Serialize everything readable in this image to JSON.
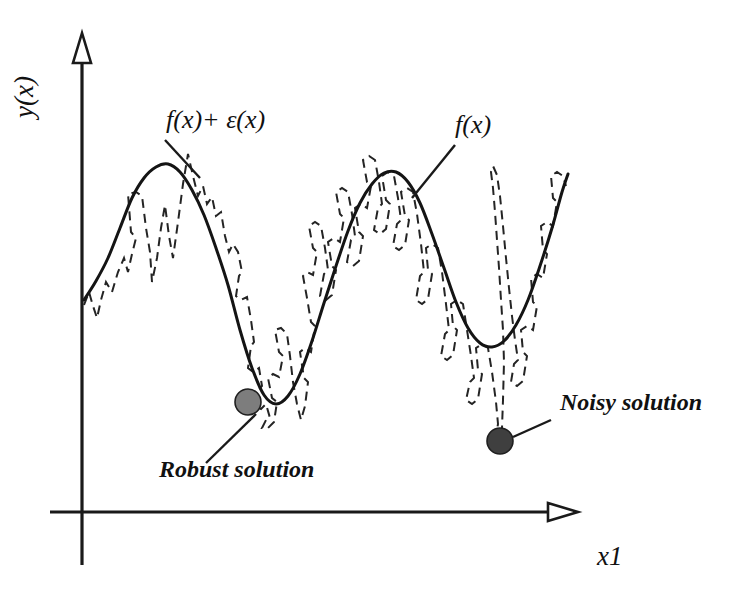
{
  "figure": {
    "background_color": "#ffffff",
    "ink_color": "#141414"
  },
  "axes": {
    "y_label": "y(x)",
    "x_label": "x1",
    "y_axis_name": "vertical-axis",
    "x_axis_name": "horizontal-axis",
    "origin": [
      82,
      512
    ],
    "y_axis_top": 33,
    "y_axis_bottom": 565,
    "x_axis_left": 50,
    "x_axis_right": 578,
    "arrow_style": "hollow-triangle"
  },
  "annotations": {
    "noisy_curve_label": "f(x)+ ε(x)",
    "smooth_curve_label": "f(x)",
    "robust_point_label": "Robust solution",
    "noisy_point_label": "Noisy solution"
  },
  "markers": {
    "robust": {
      "label": "Robust solution",
      "x": 248,
      "y": 402,
      "radius": 13,
      "fill": "#7d7d7d",
      "stroke": "#1f1f1f"
    },
    "noisy": {
      "label": "Noisy solution",
      "x": 500,
      "y": 441,
      "radius": 13,
      "fill": "#3f3f3f",
      "stroke": "#1f1f1f"
    }
  },
  "label_positions": {
    "noisy_curve": {
      "x": 166,
      "y": 128,
      "leader": [
        165,
        140,
        200,
        178
      ]
    },
    "smooth_curve": {
      "x": 455,
      "y": 133,
      "leader": [
        455,
        145,
        412,
        198
      ]
    },
    "robust_point": {
      "x": 159,
      "y": 477,
      "leader": [
        256,
        414,
        206,
        463
      ]
    },
    "noisy_point": {
      "x": 560,
      "y": 410,
      "leader": [
        513,
        437,
        551,
        420
      ]
    },
    "y_axis_label": {
      "x": 33,
      "y": 76
    },
    "x_axis_label": {
      "x": 597,
      "y": 565
    }
  },
  "chart_data": {
    "type": "line",
    "title": "",
    "xlabel": "x1",
    "ylabel": "y(x)",
    "grid": false,
    "legend_position": "inline-annotations",
    "axis_ranges": {
      "x": [
        82,
        578
      ],
      "y_pixels": [
        512,
        33
      ]
    },
    "series": [
      {
        "name": "f(x)",
        "style": "solid",
        "color": "#141414",
        "description": "Smooth underlying objective function with two maxima and two minima; global-shaped basin on left is wide, basin on right is narrower.",
        "points": [
          [
            84,
            300
          ],
          [
            96,
            281
          ],
          [
            108,
            258
          ],
          [
            120,
            228
          ],
          [
            132,
            198
          ],
          [
            144,
            178
          ],
          [
            156,
            167
          ],
          [
            168,
            164
          ],
          [
            180,
            172
          ],
          [
            192,
            190
          ],
          [
            204,
            215
          ],
          [
            216,
            248
          ],
          [
            228,
            285
          ],
          [
            240,
            330
          ],
          [
            252,
            368
          ],
          [
            264,
            395
          ],
          [
            276,
            404
          ],
          [
            288,
            396
          ],
          [
            300,
            374
          ],
          [
            312,
            341
          ],
          [
            324,
            303
          ],
          [
            336,
            266
          ],
          [
            348,
            231
          ],
          [
            360,
            203
          ],
          [
            372,
            184
          ],
          [
            384,
            173
          ],
          [
            396,
            172
          ],
          [
            408,
            182
          ],
          [
            420,
            203
          ],
          [
            432,
            234
          ],
          [
            444,
            268
          ],
          [
            456,
            302
          ],
          [
            468,
            328
          ],
          [
            480,
            343
          ],
          [
            492,
            347
          ],
          [
            504,
            341
          ],
          [
            516,
            325
          ],
          [
            528,
            300
          ],
          [
            540,
            266
          ],
          [
            552,
            228
          ],
          [
            562,
            192
          ],
          [
            568,
            174
          ]
        ]
      },
      {
        "name": "f(x)+ε(x)",
        "style": "dashed",
        "color": "#242424",
        "description": "Noisy observed function: underlying smooth curve plus high-frequency jagged perturbation; has a deep narrow spike near x=500 producing a spurious global minimum (the noisy solution).",
        "points": [
          [
            84,
            305
          ],
          [
            89,
            292
          ],
          [
            93,
            306
          ],
          [
            97,
            318
          ],
          [
            101,
            300
          ],
          [
            106,
            282
          ],
          [
            112,
            292
          ],
          [
            118,
            272
          ],
          [
            124,
            258
          ],
          [
            128,
            272
          ],
          [
            132,
            254
          ],
          [
            136,
            238
          ],
          [
            131,
            232
          ],
          [
            128,
            194
          ],
          [
            136,
            192
          ],
          [
            142,
            196
          ],
          [
            146,
            228
          ],
          [
            150,
            252
          ],
          [
            152,
            282
          ],
          [
            157,
            258
          ],
          [
            161,
            228
          ],
          [
            165,
            205
          ],
          [
            169,
            236
          ],
          [
            173,
            258
          ],
          [
            178,
            222
          ],
          [
            183,
            184
          ],
          [
            188,
            154
          ],
          [
            193,
            176
          ],
          [
            198,
            196
          ],
          [
            203,
            186
          ],
          [
            207,
            204
          ],
          [
            212,
            197
          ],
          [
            216,
            216
          ],
          [
            221,
            212
          ],
          [
            225,
            236
          ],
          [
            229,
            252
          ],
          [
            233,
            244
          ],
          [
            238,
            252
          ],
          [
            242,
            272
          ],
          [
            239,
            276
          ],
          [
            236,
            296
          ],
          [
            241,
            300
          ],
          [
            247,
            297
          ],
          [
            251,
            320
          ],
          [
            254,
            342
          ],
          [
            251,
            346
          ],
          [
            248,
            368
          ],
          [
            253,
            372
          ],
          [
            259,
            368
          ],
          [
            262,
            386
          ],
          [
            258,
            390
          ],
          [
            255,
            406
          ],
          [
            261,
            409
          ],
          [
            266,
            404
          ],
          [
            270,
            418
          ],
          [
            266,
            420
          ],
          [
            262,
            428
          ],
          [
            268,
            428
          ],
          [
            274,
            422
          ],
          [
            277,
            402
          ],
          [
            272,
            398
          ],
          [
            268,
            378
          ],
          [
            273,
            374
          ],
          [
            279,
            377
          ],
          [
            283,
            356
          ],
          [
            279,
            352
          ],
          [
            275,
            330
          ],
          [
            281,
            328
          ],
          [
            287,
            334
          ],
          [
            290,
            356
          ],
          [
            293,
            382
          ],
          [
            297,
            404
          ],
          [
            301,
            420
          ],
          [
            305,
            406
          ],
          [
            308,
            382
          ],
          [
            304,
            378
          ],
          [
            300,
            352
          ],
          [
            305,
            348
          ],
          [
            311,
            352
          ],
          [
            315,
            326
          ],
          [
            311,
            322
          ],
          [
            307,
            298
          ],
          [
            303,
            276
          ],
          [
            307,
            272
          ],
          [
            313,
            275
          ],
          [
            317,
            252
          ],
          [
            313,
            248
          ],
          [
            309,
            226
          ],
          [
            315,
            222
          ],
          [
            321,
            226
          ],
          [
            325,
            248
          ],
          [
            328,
            270
          ],
          [
            324,
            274
          ],
          [
            320,
            296
          ],
          [
            326,
            300
          ],
          [
            332,
            295
          ],
          [
            336,
            270
          ],
          [
            332,
            266
          ],
          [
            328,
            242
          ],
          [
            334,
            238
          ],
          [
            340,
            242
          ],
          [
            344,
            218
          ],
          [
            340,
            214
          ],
          [
            336,
            192
          ],
          [
            342,
            188
          ],
          [
            348,
            192
          ],
          [
            352,
            214
          ],
          [
            355,
            236
          ],
          [
            351,
            240
          ],
          [
            347,
            262
          ],
          [
            353,
            266
          ],
          [
            359,
            261
          ],
          [
            363,
            236
          ],
          [
            359,
            232
          ],
          [
            355,
            208
          ],
          [
            361,
            204
          ],
          [
            367,
            208
          ],
          [
            371,
            186
          ],
          [
            367,
            182
          ],
          [
            363,
            160
          ],
          [
            369,
            156
          ],
          [
            375,
            160
          ],
          [
            379,
            182
          ],
          [
            382,
            204
          ],
          [
            378,
            208
          ],
          [
            374,
            230
          ],
          [
            380,
            234
          ],
          [
            386,
            229
          ],
          [
            390,
            204
          ],
          [
            386,
            200
          ],
          [
            382,
            176
          ],
          [
            388,
            172
          ],
          [
            394,
            176
          ],
          [
            398,
            198
          ],
          [
            401,
            220
          ],
          [
            397,
            224
          ],
          [
            393,
            246
          ],
          [
            399,
            250
          ],
          [
            405,
            245
          ],
          [
            409,
            220
          ],
          [
            405,
            216
          ],
          [
            401,
            192
          ],
          [
            407,
            188
          ],
          [
            413,
            192
          ],
          [
            417,
            214
          ],
          [
            421,
            244
          ],
          [
            424,
            272
          ],
          [
            420,
            276
          ],
          [
            416,
            300
          ],
          [
            422,
            304
          ],
          [
            428,
            299
          ],
          [
            432,
            274
          ],
          [
            428,
            270
          ],
          [
            426,
            248
          ],
          [
            432,
            244
          ],
          [
            438,
            248
          ],
          [
            442,
            272
          ],
          [
            446,
            304
          ],
          [
            449,
            330
          ],
          [
            445,
            334
          ],
          [
            441,
            356
          ],
          [
            447,
            360
          ],
          [
            453,
            355
          ],
          [
            457,
            330
          ],
          [
            453,
            326
          ],
          [
            451,
            304
          ],
          [
            457,
            300
          ],
          [
            463,
            304
          ],
          [
            467,
            330
          ],
          [
            471,
            356
          ],
          [
            474,
            378
          ],
          [
            470,
            382
          ],
          [
            466,
            400
          ],
          [
            472,
            404
          ],
          [
            478,
            399
          ],
          [
            482,
            374
          ],
          [
            478,
            370
          ],
          [
            476,
            348
          ],
          [
            482,
            344
          ],
          [
            488,
            348
          ],
          [
            492,
            372
          ],
          [
            496,
            402
          ],
          [
            498,
            424
          ],
          [
            496,
            436
          ],
          [
            500,
            440
          ],
          [
            502,
            428
          ],
          [
            503,
            400
          ],
          [
            504,
            362
          ],
          [
            503,
            330
          ],
          [
            501,
            300
          ],
          [
            499,
            268
          ],
          [
            497,
            240
          ],
          [
            495,
            212
          ],
          [
            493,
            188
          ],
          [
            491,
            172
          ],
          [
            493,
            166
          ],
          [
            497,
            175
          ],
          [
            500,
            196
          ],
          [
            503,
            226
          ],
          [
            506,
            258
          ],
          [
            509,
            288
          ],
          [
            512,
            316
          ],
          [
            515,
            340
          ],
          [
            518,
            360
          ],
          [
            514,
            364
          ],
          [
            511,
            382
          ],
          [
            517,
            386
          ],
          [
            523,
            381
          ],
          [
            527,
            356
          ],
          [
            523,
            352
          ],
          [
            521,
            330
          ],
          [
            527,
            326
          ],
          [
            533,
            330
          ],
          [
            537,
            306
          ],
          [
            533,
            302
          ],
          [
            531,
            278
          ],
          [
            537,
            274
          ],
          [
            543,
            278
          ],
          [
            547,
            254
          ],
          [
            543,
            250
          ],
          [
            541,
            226
          ],
          [
            547,
            222
          ],
          [
            553,
            226
          ],
          [
            557,
            202
          ],
          [
            553,
            198
          ],
          [
            551,
            176
          ],
          [
            557,
            172
          ],
          [
            563,
            176
          ],
          [
            566,
            186
          ]
        ]
      }
    ]
  }
}
